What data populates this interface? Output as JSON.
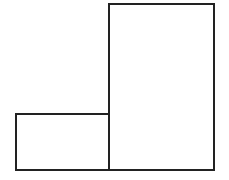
{
  "diagram": {
    "canvas": {
      "width": 229,
      "height": 180,
      "background": "#ffffff"
    },
    "stroke": {
      "color": "#222222",
      "width": 2
    },
    "shapes": [
      {
        "id": "large-rectangle",
        "type": "rectangle",
        "x": 108,
        "y": 3,
        "width": 107,
        "height": 168,
        "label": ""
      },
      {
        "id": "small-rectangle",
        "type": "rectangle",
        "x": 15,
        "y": 113,
        "width": 95,
        "height": 58,
        "label": ""
      }
    ]
  }
}
